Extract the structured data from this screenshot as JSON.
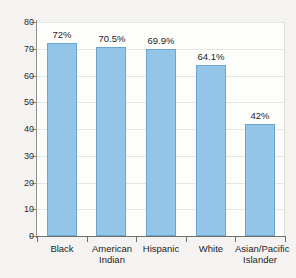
{
  "chart_data": {
    "type": "bar",
    "title": "",
    "subtitle": "",
    "xlabel": "",
    "ylabel": "",
    "ylim": [
      0,
      80
    ],
    "y_ticks": [
      0,
      10,
      20,
      30,
      40,
      50,
      60,
      70,
      80
    ],
    "y_tick_labels": [
      "0",
      "10",
      "20",
      "30",
      "40",
      "50",
      "60",
      "70",
      "80"
    ],
    "grid": true,
    "legend": null,
    "categories": [
      "Black",
      "American\nIndian",
      "Hispanic",
      "White",
      "Asian/Pacific\nIslander"
    ],
    "values": [
      72,
      70.5,
      69.9,
      64.1,
      42
    ],
    "data_labels": [
      "72%",
      "70.5%",
      "69.9%",
      "64.1%",
      "42%"
    ],
    "bar_color": "#92c5e8",
    "bar_edge_color": "#6ca6cf",
    "axis_color": "#8d8d8a",
    "grid_color": "#e6e6e2",
    "background_color": "#f4f3f1",
    "plot_background_color": "#fdfdfc"
  }
}
